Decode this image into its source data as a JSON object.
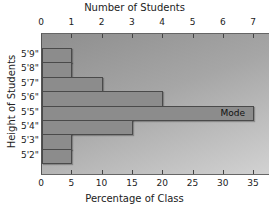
{
  "chart_data": {
    "type": "bar",
    "orientation": "horizontal",
    "title": "",
    "top_axis_label": "Number of Students",
    "xlabel": "Percentage of Class",
    "ylabel": "Height of Students",
    "categories": [
      "5'9\"",
      "5'8\"",
      "5'7\"",
      "5'6\"",
      "5'5\"",
      "5'4\"",
      "5'3\"",
      "5'2\""
    ],
    "series": [
      {
        "name": "Number of Students",
        "values": [
          1,
          1,
          2,
          4,
          7,
          3,
          1,
          1
        ]
      },
      {
        "name": "Percentage of Class",
        "values": [
          5,
          5,
          10,
          20,
          35,
          15,
          5,
          5
        ]
      }
    ],
    "top_ticks": [
      "0",
      "1",
      "2",
      "3",
      "4",
      "5",
      "6",
      "7"
    ],
    "bottom_ticks": [
      "0",
      "5",
      "10",
      "15",
      "20",
      "25",
      "30",
      "35"
    ],
    "xlim_percent": [
      0,
      37
    ],
    "xlim_students": [
      0,
      7.4
    ],
    "annotations": [
      {
        "category": "5'5\"",
        "text": "Mode"
      }
    ],
    "grid": false,
    "legend": null
  },
  "labels": {
    "top_axis": "Number of Students",
    "bottom_axis": "Percentage of Class",
    "y_axis": "Height of Students",
    "mode": "Mode"
  }
}
